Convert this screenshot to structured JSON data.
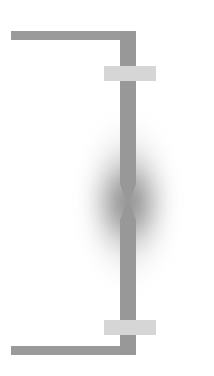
{
  "figure": {
    "kind": "schematic-diagram",
    "canvas": {
      "width": 214,
      "height": 376,
      "background": "#ffffff"
    }
  },
  "colors": {
    "background": "#ffffff",
    "specimen_gray": "#989898",
    "arm_gray": "#9a9a9a",
    "clamp_light_gray": "#d6d6d6",
    "glow_gray": "#787878"
  },
  "parts": [
    {
      "name": "upper-crosshead-arm",
      "label": "",
      "shape": "horizontal-bar",
      "color": "#9a9a9a",
      "x": 11,
      "y": 31,
      "width": 125,
      "height": 9
    },
    {
      "name": "upper-specimen-shaft",
      "label": "",
      "shape": "vertical-bar",
      "color": "#989898",
      "x": 120,
      "y": 31,
      "width": 16,
      "height": 153
    },
    {
      "name": "upper-clamp-jaw",
      "label": "",
      "shape": "horizontal-block",
      "color": "#d6d6d6",
      "x": 104,
      "y": 66,
      "width": 52,
      "height": 15
    },
    {
      "name": "upper-neck-taper",
      "label": "",
      "shape": "tapered-wedge-down",
      "color": "#989898",
      "x": 120,
      "y": 184,
      "width": 16,
      "height": 19
    },
    {
      "name": "fracture-neck-point",
      "label": "",
      "shape": "pinch-point",
      "x": 128,
      "y": 202
    },
    {
      "name": "lower-neck-taper",
      "label": "",
      "shape": "tapered-wedge-up",
      "color": "#989898",
      "x": 120,
      "y": 201,
      "width": 16,
      "height": 19
    },
    {
      "name": "lower-specimen-shaft",
      "label": "",
      "shape": "vertical-bar",
      "color": "#989898",
      "x": 120,
      "y": 220,
      "width": 16,
      "height": 135
    },
    {
      "name": "lower-clamp-jaw",
      "label": "",
      "shape": "horizontal-block",
      "color": "#d6d6d6",
      "x": 104,
      "y": 320,
      "width": 52,
      "height": 15
    },
    {
      "name": "lower-crosshead-arm",
      "label": "",
      "shape": "horizontal-bar",
      "color": "#9a9a9a",
      "x": 11,
      "y": 346,
      "width": 125,
      "height": 9
    },
    {
      "name": "stress-concentration-halo",
      "label": "",
      "shape": "radial-gradient-ellipse",
      "color": "#787878",
      "x": 73,
      "y": 107,
      "width": 110,
      "height": 190
    }
  ],
  "annotations": {
    "labels": [],
    "axis_labels": [],
    "legend": []
  }
}
